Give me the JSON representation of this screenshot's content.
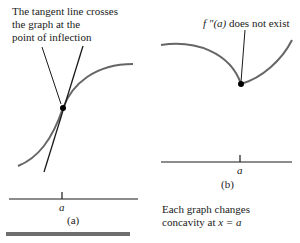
{
  "panel_a": {
    "annotation_lines": [
      "The tangent line crosses",
      "the graph at the",
      "point of inflection"
    ],
    "axis_label": "a",
    "caption": "(a)"
  },
  "panel_b": {
    "annotation_prefix": "f ″(a)",
    "annotation_suffix": " does not exist",
    "axis_label": "a",
    "caption": "(b)"
  },
  "footer_note": {
    "line1": "Each graph changes",
    "line2_prefix": "concavity at ",
    "line2_math": "x = a"
  },
  "colors": {
    "curve": "#666666",
    "line": "#1a1a1a",
    "bar": "#6e6e6e"
  }
}
